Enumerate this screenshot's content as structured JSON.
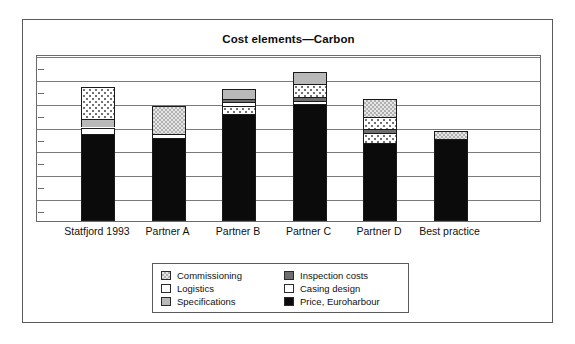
{
  "figure": {
    "title": "Cost elements—Carbon"
  },
  "chart_data": {
    "type": "bar",
    "subtype": "stacked-bar",
    "title": "Cost elements—Carbon",
    "xlabel": "",
    "ylabel": "",
    "grid": true,
    "gridlines": 7,
    "y_tick_labels": [],
    "ylim": [
      0,
      100
    ],
    "legend_position": "bottom-center",
    "categories": [
      "Statfjord 1993",
      "Partner A",
      "Partner B",
      "Partner C",
      "Partner D",
      "Best practice"
    ],
    "series": [
      {
        "name": "Price, Euroharbour",
        "color": "#0b0b0b",
        "pattern": "solid-black",
        "values": [
          52,
          50,
          64,
          70,
          47,
          49
        ]
      },
      {
        "name": "Casing design",
        "color": "#ffffff",
        "pattern": "solid-white",
        "values": [
          4,
          2,
          2,
          2,
          2,
          0
        ]
      },
      {
        "name": "Inspection costs",
        "color": "#6e6e6e",
        "pattern": "solid-darkgray",
        "values": [
          0,
          0,
          2,
          2,
          2,
          0
        ]
      },
      {
        "name": "Specifications",
        "color": "#b9b9b9",
        "pattern": "solid-lightgray",
        "values": [
          5,
          0,
          6,
          7,
          0,
          0
        ]
      },
      {
        "name": "Logistics",
        "color": "#ffffff",
        "pattern": "white-with-dots",
        "values": [
          19,
          0,
          5,
          8,
          13,
          0
        ]
      },
      {
        "name": "Commissioning",
        "color": "#d2d2d2",
        "pattern": "checkered",
        "values": [
          0,
          17,
          0,
          0,
          11,
          5
        ]
      }
    ],
    "bars": [
      {
        "category": "Statfjord 1993",
        "segments": [
          {
            "name": "Price, Euroharbour",
            "value": 52,
            "fill": "fill-price"
          },
          {
            "name": "Casing design",
            "value": 4,
            "fill": "fill-casing"
          },
          {
            "name": "Specifications",
            "value": 5,
            "fill": "fill-specifications"
          },
          {
            "name": "Logistics",
            "value": 19,
            "fill": "fill-logistics"
          }
        ]
      },
      {
        "category": "Partner A",
        "segments": [
          {
            "name": "Price, Euroharbour",
            "value": 50,
            "fill": "fill-price"
          },
          {
            "name": "Casing design",
            "value": 2,
            "fill": "fill-casing"
          },
          {
            "name": "Commissioning",
            "value": 17,
            "fill": "fill-commissioning"
          }
        ]
      },
      {
        "category": "Partner B",
        "segments": [
          {
            "name": "Price, Euroharbour",
            "value": 64,
            "fill": "fill-price"
          },
          {
            "name": "Logistics",
            "value": 5,
            "fill": "fill-logistics"
          },
          {
            "name": "Casing design",
            "value": 2,
            "fill": "fill-casing"
          },
          {
            "name": "Inspection costs",
            "value": 2,
            "fill": "fill-inspection"
          },
          {
            "name": "Specifications",
            "value": 6,
            "fill": "fill-specifications"
          }
        ]
      },
      {
        "category": "Partner C",
        "segments": [
          {
            "name": "Price, Euroharbour",
            "value": 70,
            "fill": "fill-price"
          },
          {
            "name": "Casing design",
            "value": 2,
            "fill": "fill-casing"
          },
          {
            "name": "Inspection costs",
            "value": 2,
            "fill": "fill-inspection"
          },
          {
            "name": "Logistics",
            "value": 8,
            "fill": "fill-logistics"
          },
          {
            "name": "Specifications",
            "value": 7,
            "fill": "fill-specifications"
          }
        ]
      },
      {
        "category": "Partner D",
        "segments": [
          {
            "name": "Price, Euroharbour",
            "value": 47,
            "fill": "fill-price"
          },
          {
            "name": "Logistics",
            "value": 6,
            "fill": "fill-logistics"
          },
          {
            "name": "Inspection costs",
            "value": 2,
            "fill": "fill-inspection"
          },
          {
            "name": "Casing design",
            "value": 7,
            "fill": "fill-logistics"
          },
          {
            "name": "Commissioning",
            "value": 11,
            "fill": "fill-commissioning"
          }
        ]
      },
      {
        "category": "Best practice",
        "segments": [
          {
            "name": "Price, Euroharbour",
            "value": 49,
            "fill": "fill-price"
          },
          {
            "name": "Commissioning",
            "value": 5,
            "fill": "fill-commissioning"
          }
        ]
      }
    ],
    "legend": {
      "left_column": [
        {
          "label": "Commissioning",
          "swatch": "fill-commissioning"
        },
        {
          "label": "Logistics",
          "swatch": "fill-casing"
        },
        {
          "label": "Specifications",
          "swatch": "fill-specifications"
        }
      ],
      "right_column": [
        {
          "label": "Inspection costs",
          "swatch": "fill-inspection"
        },
        {
          "label": "Casing design",
          "swatch": "fill-casing"
        },
        {
          "label": "Price, Euroharbour",
          "swatch": "fill-price"
        }
      ]
    }
  }
}
